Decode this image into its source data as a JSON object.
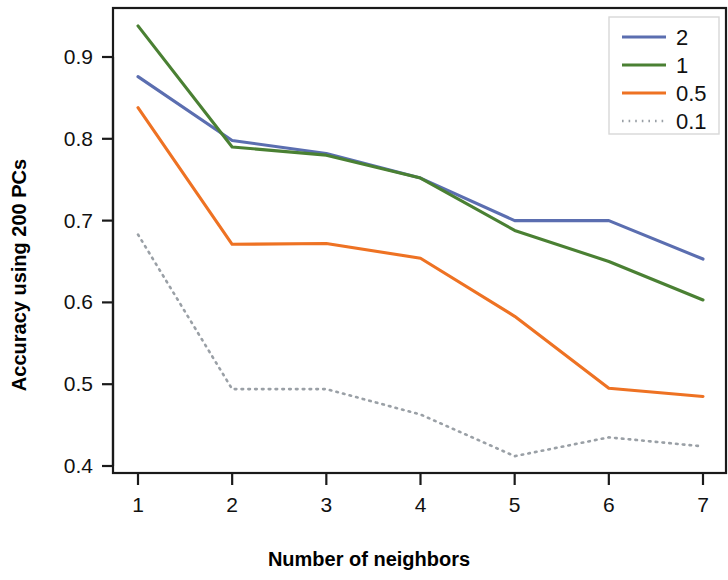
{
  "chart_data": {
    "type": "line",
    "title": "",
    "xlabel": "Number of neighbors",
    "ylabel": "Accuracy using 200 PCs",
    "x": [
      1,
      2,
      3,
      4,
      5,
      6,
      7
    ],
    "xticklabels": [
      "1",
      "2",
      "3",
      "4",
      "5",
      "6",
      "7"
    ],
    "yticklabels": [
      "0.4",
      "0.5",
      "0.6",
      "0.7",
      "0.8",
      "0.9"
    ],
    "yticks": [
      0.4,
      0.5,
      0.6,
      0.7,
      0.8,
      0.9
    ],
    "xlim": [
      0.6,
      7.25
    ],
    "ylim": [
      0.378,
      0.952
    ],
    "grid": false,
    "legend_position": "top-right",
    "series": [
      {
        "name": "2",
        "color": "#5b6eb0",
        "style": "solid",
        "values": [
          0.876,
          0.798,
          0.782,
          0.752,
          0.7,
          0.7,
          0.653
        ]
      },
      {
        "name": "1",
        "color": "#4a8033",
        "style": "solid",
        "values": [
          0.938,
          0.79,
          0.78,
          0.752,
          0.688,
          0.65,
          0.603
        ]
      },
      {
        "name": "0.5",
        "color": "#ee7223",
        "style": "solid",
        "values": [
          0.838,
          0.671,
          0.672,
          0.654,
          0.583,
          0.495,
          0.485
        ]
      },
      {
        "name": "0.1",
        "color": "#9aa0a6",
        "style": "dotted",
        "values": [
          0.683,
          0.494,
          0.494,
          0.463,
          0.412,
          0.435,
          0.424
        ]
      }
    ]
  },
  "axes": {
    "x_title": "Number of neighbors",
    "y_title": "Accuracy using 200 PCs"
  },
  "legend": {
    "entries": [
      {
        "label": "2"
      },
      {
        "label": "1"
      },
      {
        "label": "0.5"
      },
      {
        "label": "0.1"
      }
    ]
  }
}
